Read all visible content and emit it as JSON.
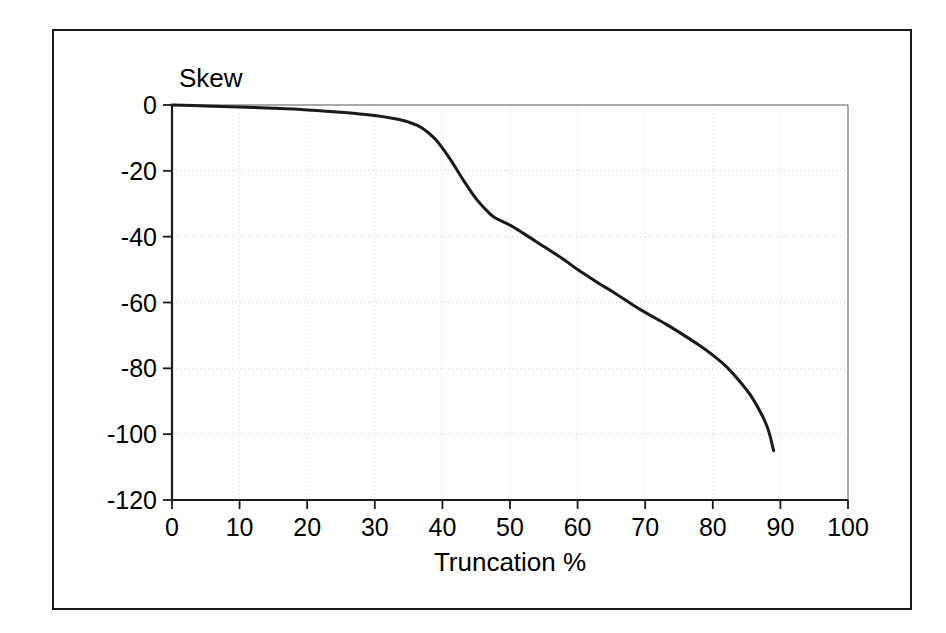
{
  "chart_data": {
    "type": "line",
    "title": "",
    "xlabel": "Truncation %",
    "ylabel": "Skew",
    "xlim": [
      0,
      100
    ],
    "ylim": [
      -120,
      0
    ],
    "xticks": [
      "0",
      "10",
      "20",
      "30",
      "40",
      "50",
      "60",
      "70",
      "80",
      "90",
      "100"
    ],
    "yticks": [
      "0",
      "-20",
      "-40",
      "-60",
      "-80",
      "-100",
      "-120"
    ],
    "grid": true,
    "grid_style": "dotted",
    "legend": "none",
    "series": [
      {
        "name": "Skew vs Truncation",
        "color": "#1a1a1a",
        "x": [
          0,
          5,
          10,
          15,
          20,
          25,
          30,
          33,
          35,
          37,
          39,
          41,
          43,
          45,
          47,
          48,
          50,
          52,
          55,
          58,
          60,
          63,
          65,
          68,
          70,
          73,
          75,
          78,
          80,
          82,
          84,
          86,
          88,
          89
        ],
        "y": [
          0,
          -0.3,
          -0.6,
          -1.0,
          -1.5,
          -2.2,
          -3.2,
          -4.2,
          -5.2,
          -7.0,
          -10.5,
          -16.0,
          -22.5,
          -28.5,
          -33.0,
          -34.5,
          -36.5,
          -39.0,
          -43.0,
          -47.0,
          -50.0,
          -54.0,
          -56.5,
          -60.5,
          -63.0,
          -66.5,
          -69.0,
          -73.0,
          -76.0,
          -79.5,
          -84.0,
          -89.5,
          -97.5,
          -105.0
        ]
      }
    ]
  },
  "figure": {
    "axis_y_label": "Skew",
    "axis_x_label": "Truncation %"
  }
}
